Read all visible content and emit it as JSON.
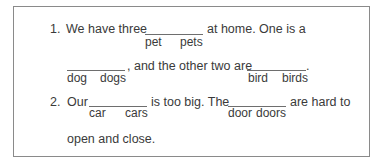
{
  "exercise": {
    "items": [
      {
        "number": "1.",
        "text_parts": [
          "We have three",
          "at home. One is a",
          ", and the other two are",
          "."
        ],
        "blanks": [
          {
            "options": [
              "pet",
              "pets"
            ]
          },
          {
            "options": [
              "dog",
              "dogs"
            ]
          },
          {
            "options": [
              "bird",
              "birds"
            ]
          }
        ]
      },
      {
        "number": "2.",
        "text_parts": [
          "Our",
          "is too big. The",
          "are hard to",
          "open and close."
        ],
        "blanks": [
          {
            "options": [
              "car",
              "cars"
            ]
          },
          {
            "options": [
              "door",
              "doors"
            ]
          }
        ]
      }
    ]
  }
}
